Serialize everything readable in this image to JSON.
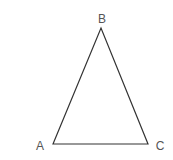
{
  "diagram": {
    "type": "triangle",
    "stroke_color": "#333333",
    "label_color": "#555555",
    "vertices": [
      {
        "name": "A",
        "x": 53,
        "y": 144,
        "label_x": 40,
        "label_y": 150
      },
      {
        "name": "B",
        "x": 101,
        "y": 28,
        "label_x": 102,
        "label_y": 23
      },
      {
        "name": "C",
        "x": 148,
        "y": 144,
        "label_x": 160,
        "label_y": 150
      }
    ],
    "edges": [
      {
        "from": "A",
        "to": "B"
      },
      {
        "from": "B",
        "to": "C"
      },
      {
        "from": "C",
        "to": "A"
      }
    ]
  }
}
